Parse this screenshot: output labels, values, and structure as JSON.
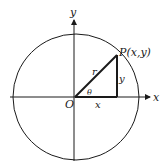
{
  "diagram": {
    "type": "unit-circle-trig-definition",
    "axes": {
      "x_label": "x",
      "y_label": "y",
      "origin_label": "O"
    },
    "point": {
      "label": "P(x,y)"
    },
    "segments": {
      "hypotenuse": "r",
      "vertical": "y",
      "horizontal": "x"
    },
    "angle_label": "θ",
    "colors": {
      "stroke": "#1a1a1a",
      "background": "#ffffff"
    }
  }
}
